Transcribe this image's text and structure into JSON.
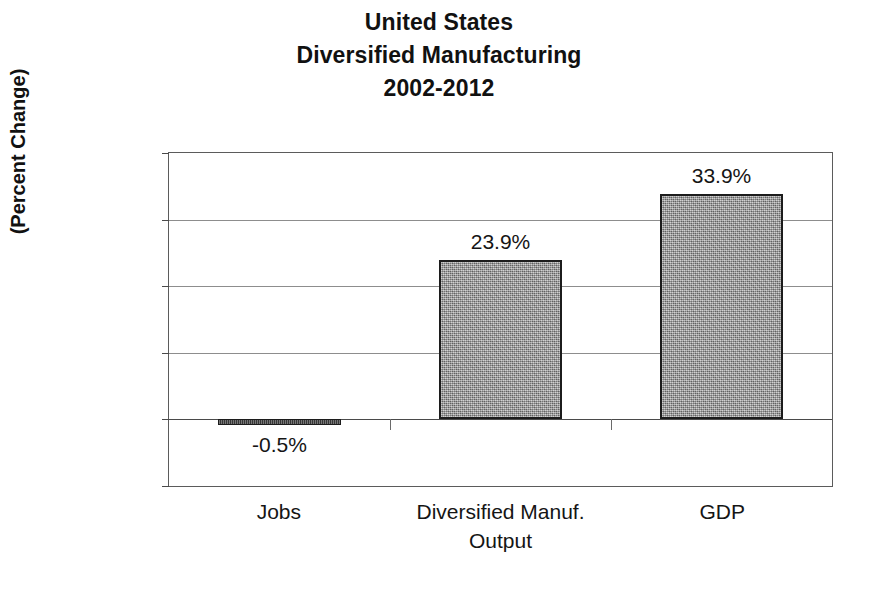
{
  "chart_data": {
    "type": "bar",
    "title": "United States Diversified Manufacturing 2002-2012",
    "title_lines": [
      "United States",
      "Diversified Manufacturing",
      "2002-2012"
    ],
    "categories": [
      "Jobs",
      "Diversified Manuf. Output",
      "GDP"
    ],
    "category_lines": [
      [
        "Jobs",
        ""
      ],
      [
        "Diversified Manuf.",
        "Output"
      ],
      [
        "GDP",
        ""
      ]
    ],
    "values": [
      -0.5,
      23.9,
      33.9
    ],
    "data_labels": [
      "-0.5%",
      "23.9%",
      "33.9%"
    ],
    "xlabel": "",
    "ylabel": "(Percent Change)",
    "ylim": [
      -10,
      40
    ],
    "ytick_values": [
      40,
      30,
      20,
      10,
      0,
      -10
    ],
    "ytick_labels": [
      "40%",
      "30%",
      "20%",
      "10%",
      "0%",
      "-10%"
    ],
    "grid": true,
    "legend": false,
    "bar_fill_color": "#9e9e9e",
    "bar_border_color": "#1c1c1c",
    "axis_color": "#5b5b5b",
    "gridline_color": "#8d8d8d",
    "background_color": "#ffffff"
  }
}
